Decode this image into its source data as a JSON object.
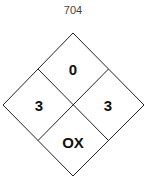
{
  "diagram": {
    "title": "704",
    "health": "3",
    "flammability": "0",
    "instability": "3",
    "special": "OX"
  },
  "colors": {
    "stroke": "#222222",
    "fill": "#ffffff",
    "text": "#111111"
  }
}
